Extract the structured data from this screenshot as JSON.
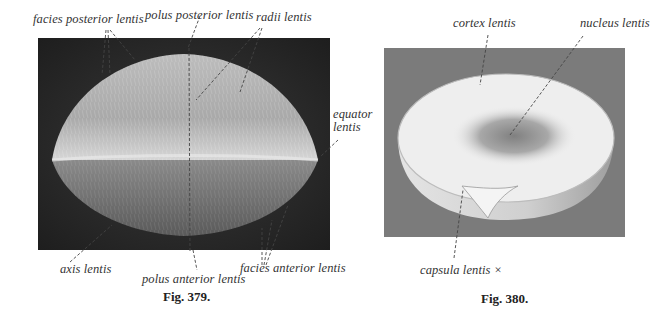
{
  "figures": [
    {
      "caption": "Fig. 379.",
      "subject": "lens-exterior-view",
      "labels": {
        "facies_posterior": "facies posterior lentis",
        "polus_posterior": "polus posterior lentis",
        "radii": "radii lentis",
        "equator_line1": "equator",
        "equator_line2": "lentis",
        "axis": "axis lentis",
        "polus_anterior": "polus anterior lentis",
        "facies_anterior": "facies anterior lentis"
      }
    },
    {
      "caption": "Fig. 380.",
      "subject": "lens-cut-section",
      "labels": {
        "cortex": "cortex lentis",
        "nucleus": "nucleus lentis",
        "capsula": "capsula lentis ×"
      }
    }
  ],
  "colors": {
    "panel_left_bg": "#2a2a2a",
    "panel_right_bg": "#7a7a7a",
    "lens_light": "#d8d8d8",
    "lens_dark": "#6a6a6a",
    "label_text": "#333333"
  }
}
